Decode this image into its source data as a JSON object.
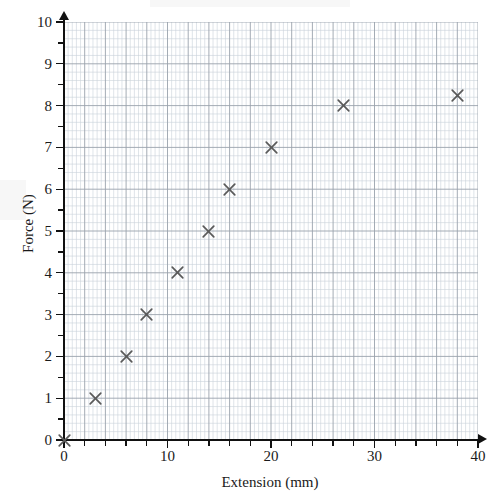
{
  "chart_data": {
    "type": "scatter",
    "title": "",
    "xlabel": "Extension (mm)",
    "ylabel": "Force (N)",
    "xlim": [
      0,
      40
    ],
    "ylim": [
      0,
      10
    ],
    "x_major_step": 10,
    "x_minor_step": 2,
    "y_major_step": 1,
    "grid": true,
    "grid_style": "graph-paper",
    "legend": null,
    "marker": "x-cross",
    "marker_color": "#5a5a5a",
    "x_tick_labels": [
      "0",
      "10",
      "20",
      "30",
      "40"
    ],
    "x_tick_values": [
      0,
      10,
      20,
      30,
      40
    ],
    "y_tick_labels": [
      "0",
      "1",
      "2",
      "3",
      "4",
      "5",
      "6",
      "7",
      "8",
      "9",
      "10"
    ],
    "y_tick_values": [
      0,
      1,
      2,
      3,
      4,
      5,
      6,
      7,
      8,
      9,
      10
    ],
    "points": [
      {
        "x": 0,
        "y": 0
      },
      {
        "x": 3,
        "y": 1
      },
      {
        "x": 6,
        "y": 2
      },
      {
        "x": 8,
        "y": 3
      },
      {
        "x": 11,
        "y": 4
      },
      {
        "x": 14,
        "y": 5
      },
      {
        "x": 16,
        "y": 6
      },
      {
        "x": 20,
        "y": 7
      },
      {
        "x": 27,
        "y": 8
      },
      {
        "x": 38,
        "y": 8.25
      }
    ],
    "x": [
      0,
      3,
      6,
      8,
      11,
      14,
      16,
      20,
      27,
      38
    ],
    "values": [
      0,
      1,
      2,
      3,
      4,
      5,
      6,
      7,
      8,
      8.25
    ]
  },
  "colors": {
    "axis": "#111111",
    "marker": "#5a5a5a",
    "grid_major": "#9aa3ad",
    "grid_minor": "#c9d2da",
    "text": "#1a1a1a",
    "background": "#ffffff"
  }
}
